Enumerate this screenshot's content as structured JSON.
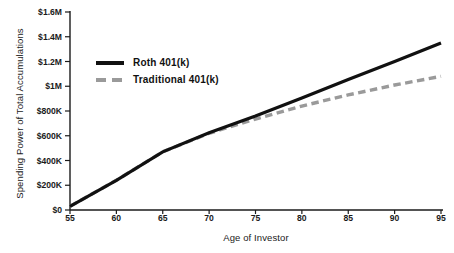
{
  "chart_data": {
    "type": "line",
    "title": "",
    "xlabel": "Age of Investor",
    "ylabel": "Spending Power of Total Accumulations",
    "xlim": [
      55,
      95
    ],
    "ylim": [
      0,
      1600000
    ],
    "grid": false,
    "legend_position": "upper-left-inside",
    "x_tick_labels": [
      "55",
      "60",
      "65",
      "70",
      "75",
      "80",
      "85",
      "90",
      "95"
    ],
    "x_ticks": [
      55,
      60,
      65,
      70,
      75,
      80,
      85,
      90,
      95
    ],
    "y_tick_labels": [
      "$0",
      "$200K",
      "$400K",
      "$600K",
      "$800K",
      "$1M",
      "$1.2M",
      "$1.4M",
      "$1.6M"
    ],
    "y_ticks": [
      0,
      200000,
      400000,
      600000,
      800000,
      1000000,
      1200000,
      1400000,
      1600000
    ],
    "x": [
      55,
      60,
      65,
      70,
      75,
      80,
      85,
      90,
      95
    ],
    "series": [
      {
        "name": "Roth 401(k)",
        "style": "solid",
        "color": "#111111",
        "values": [
          30000,
          240000,
          470000,
          625000,
          760000,
          905000,
          1055000,
          1200000,
          1350000
        ]
      },
      {
        "name": "Traditional  401(k)",
        "style": "dashed",
        "color": "#9a9a9a",
        "values": [
          30000,
          240000,
          470000,
          620000,
          735000,
          840000,
          930000,
          1010000,
          1080000
        ]
      }
    ]
  },
  "legend": {
    "items": [
      {
        "label": "Roth 401(k)",
        "swatch": "solid-line-swatch"
      },
      {
        "label": "Traditional  401(k)",
        "swatch": "dashed-line-swatch"
      }
    ]
  },
  "colors": {
    "roth": "#111111",
    "traditional": "#9a9a9a",
    "axis": "#1a1a1a",
    "background": "#ffffff"
  }
}
